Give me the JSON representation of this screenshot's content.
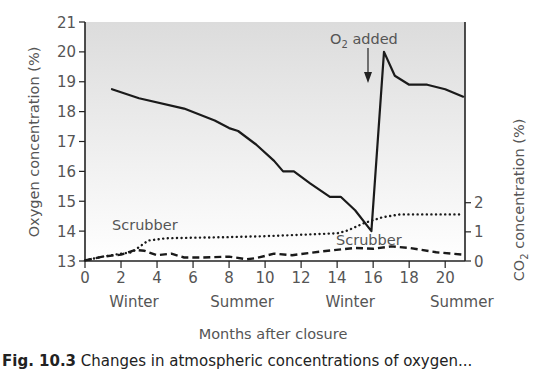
{
  "chart_data": {
    "type": "line",
    "title": "",
    "xlabel": "Months after closure",
    "ylabel": "Oxygen concentration (%)",
    "y2label": "CO2 concentration (%)",
    "xlim": [
      0,
      21.1
    ],
    "ylim": [
      13,
      21
    ],
    "y2lim": [
      0,
      8.2
    ],
    "x_ticks": [
      0,
      2,
      4,
      6,
      8,
      10,
      12,
      14,
      16,
      18,
      20
    ],
    "y_ticks": [
      13,
      14,
      15,
      16,
      17,
      18,
      19,
      20,
      21
    ],
    "y2_ticks": [
      0,
      1,
      2
    ],
    "season_labels": [
      {
        "label": "Winter",
        "x": 3
      },
      {
        "label": "Summer",
        "x": 9
      },
      {
        "label": "Winter",
        "x": 15
      },
      {
        "label": "Summer",
        "x": 21.2
      }
    ],
    "grid": false,
    "background": "gradient gray (top) to white (bottom)",
    "series": [
      {
        "name": "Oxygen",
        "axis": "left",
        "style": "solid",
        "x": [
          1.5,
          3,
          5.5,
          7.2,
          8,
          8.5,
          9.5,
          10.5,
          11,
          11.6,
          12.5,
          13.6,
          14.2,
          15,
          15.9,
          16.6,
          17.2,
          18,
          19,
          20,
          21
        ],
        "y": [
          18.75,
          18.45,
          18.1,
          17.7,
          17.45,
          17.35,
          16.9,
          16.35,
          16.0,
          16.0,
          15.6,
          15.15,
          15.15,
          14.7,
          14.0,
          20.0,
          19.2,
          18.9,
          18.9,
          18.75,
          18.5
        ]
      },
      {
        "name": "CO2 (with scrubber, upper)",
        "axis": "right",
        "style": "dotted",
        "x": [
          0,
          1,
          2,
          2.6,
          3.5,
          4.5,
          6,
          8,
          10,
          12,
          14,
          14.6,
          15.5,
          16.5,
          17.5,
          19,
          21
        ],
        "y": [
          0.02,
          0.15,
          0.25,
          0.3,
          0.7,
          0.78,
          0.8,
          0.82,
          0.85,
          0.9,
          0.95,
          1.05,
          1.3,
          1.5,
          1.6,
          1.6,
          1.6
        ]
      },
      {
        "name": "CO2 (scrubber, lower)",
        "axis": "right",
        "style": "dashed",
        "x": [
          0,
          1,
          2,
          2.8,
          3.3,
          4,
          4.8,
          5.5,
          6.5,
          8,
          9,
          9.5,
          10.5,
          11.5,
          13,
          15,
          16,
          17,
          18,
          19.5,
          21
        ],
        "y": [
          0.02,
          0.15,
          0.22,
          0.38,
          0.35,
          0.2,
          0.25,
          0.12,
          0.12,
          0.15,
          0.06,
          0.1,
          0.25,
          0.2,
          0.32,
          0.45,
          0.42,
          0.5,
          0.45,
          0.3,
          0.22
        ]
      }
    ],
    "annotations": [
      {
        "text": "O2 added",
        "x": 16,
        "arrow_to_y": 20.0
      },
      {
        "text": "Scrubber",
        "x": 3,
        "y2": 1.05
      },
      {
        "text": "Scrubber",
        "x": 16.5,
        "y2": 0.65
      }
    ]
  },
  "labels": {
    "ylabel_left": "Oxygen concentration (%)",
    "ylabel_right_prefix": "CO",
    "ylabel_right_sub": "2",
    "ylabel_right_suffix": " concentration (%)",
    "xlabel": "Months after closure",
    "o2_prefix": "O",
    "o2_sub": "2",
    "o2_suffix": " added",
    "scrubber_1": "Scrubber",
    "scrubber_2": "Scrubber"
  },
  "caption": {
    "label": "Fig. 10.3",
    "text": " Changes in atmospheric concentrations of oxygen..."
  }
}
